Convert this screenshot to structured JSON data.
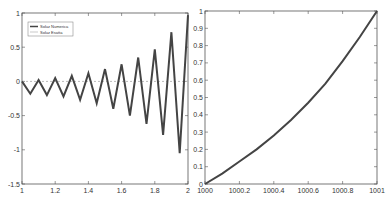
{
  "chart_data": [
    {
      "type": "line",
      "title": "",
      "xlabel": "",
      "ylabel": "",
      "xlim": [
        1,
        2
      ],
      "ylim": [
        -1.5,
        1
      ],
      "xticks": [
        "1",
        "1.2",
        "1.4",
        "1.6",
        "1.8",
        "2"
      ],
      "yticks": [
        "-1.5",
        "-1",
        "-0.5",
        "0",
        "0.5",
        "1"
      ],
      "grid": false,
      "legend": {
        "position": "upper-left",
        "entries": [
          "Soluz Numerica",
          "Soluz Esatta"
        ]
      },
      "series": [
        {
          "name": "Soluz Numerica",
          "color": "#444444",
          "x": [
            1.0,
            1.05,
            1.1,
            1.15,
            1.2,
            1.25,
            1.3,
            1.35,
            1.4,
            1.45,
            1.5,
            1.55,
            1.6,
            1.65,
            1.7,
            1.75,
            1.8,
            1.85,
            1.9,
            1.95,
            2.0
          ],
          "y": [
            0.0,
            -0.18,
            0.02,
            -0.2,
            0.05,
            -0.22,
            0.08,
            -0.27,
            0.12,
            -0.32,
            0.18,
            -0.4,
            0.25,
            -0.5,
            0.35,
            -0.62,
            0.47,
            -0.78,
            0.72,
            -1.05,
            0.97
          ]
        },
        {
          "name": "Soluz Esatta",
          "color": "#bbbbbb",
          "x": [
            1.0,
            2.0
          ],
          "y": [
            0.0,
            0.0
          ]
        }
      ]
    },
    {
      "type": "line",
      "title": "",
      "xlabel": "",
      "ylabel": "",
      "xlim": [
        1000,
        1001
      ],
      "ylim": [
        0,
        1
      ],
      "xticks": [
        "1000",
        "1000.2",
        "1000.4",
        "1000.6",
        "1000.8",
        "1001"
      ],
      "yticks": [
        "0",
        "0.1",
        "0.2",
        "0.3",
        "0.4",
        "0.5",
        "0.6",
        "0.7",
        "0.8",
        "0.9",
        "1"
      ],
      "grid": false,
      "series": [
        {
          "name": "curve",
          "color": "#444444",
          "x": [
            1000.0,
            1000.1,
            1000.2,
            1000.3,
            1000.4,
            1000.5,
            1000.6,
            1000.7,
            1000.8,
            1000.9,
            1001.0
          ],
          "y": [
            0.0,
            0.06,
            0.13,
            0.2,
            0.28,
            0.37,
            0.47,
            0.58,
            0.71,
            0.85,
            1.0
          ]
        }
      ]
    }
  ]
}
